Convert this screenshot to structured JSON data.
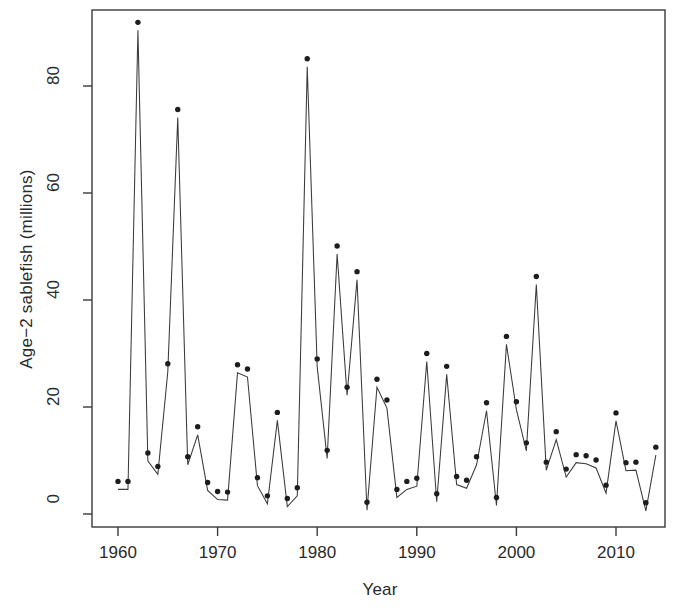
{
  "figure": {
    "background_color": "#ffffff",
    "ink_color": "#2a2a2a"
  },
  "axes": {
    "xlabel": "Year",
    "ylabel": "Age−2 sablefish (millions)",
    "xticks": [
      1960,
      1970,
      1980,
      1990,
      2000,
      2010
    ],
    "xtick_labels": [
      "1960",
      "1970",
      "1980",
      "1990",
      "2000",
      "2010"
    ],
    "yticks": [
      0,
      20,
      40,
      60,
      80
    ],
    "ytick_labels": [
      "0",
      "20",
      "40",
      "60",
      "80"
    ],
    "xlim": [
      1958.6,
      1915.0
    ],
    "ylim": [
      0,
      95
    ]
  },
  "chart_data": {
    "type": "line",
    "title": "",
    "xlabel": "Year",
    "ylabel": "Age−2 sablefish (millions)",
    "xlim": [
      1958.6,
      1915.0
    ],
    "ylim": [
      0,
      95
    ],
    "grid": false,
    "legend": "none",
    "marker": "filled-circle",
    "line_style": "solid",
    "series": [
      {
        "name": "Age-2 sablefish recruitment",
        "x": [
          1960,
          1961,
          1962,
          1963,
          1964,
          1965,
          1966,
          1967,
          1968,
          1969,
          1970,
          1971,
          1972,
          1973,
          1974,
          1975,
          1976,
          1977,
          1978,
          1979,
          1980,
          1981,
          1982,
          1983,
          1984,
          1985,
          1986,
          1987,
          1988,
          1989,
          1990,
          1991,
          1992,
          1993,
          1994,
          1995,
          1996,
          1997,
          1998,
          1999,
          2000,
          2001,
          2002,
          2003,
          2004,
          2005,
          2006,
          2007,
          2008,
          2009,
          2010,
          2011,
          2012,
          2013,
          2014
        ],
        "values": [
          4.6,
          4.6,
          90.4,
          9.9,
          7.4,
          26.6,
          74.1,
          9.2,
          14.8,
          4.4,
          2.7,
          2.6,
          26.4,
          25.6,
          5.3,
          1.9,
          17.5,
          1.4,
          3.4,
          83.6,
          27.5,
          10.4,
          48.6,
          22.2,
          43.8,
          0.7,
          23.7,
          19.8,
          3.1,
          4.6,
          5.2,
          28.5,
          2.3,
          26.1,
          5.5,
          4.8,
          9.2,
          19.3,
          1.6,
          31.7,
          19.5,
          11.8,
          42.9,
          8.2,
          13.9,
          6.9,
          9.6,
          9.4,
          8.6,
          3.9,
          17.4,
          8.1,
          8.2,
          0.6,
          11.0
        ]
      }
    ]
  }
}
